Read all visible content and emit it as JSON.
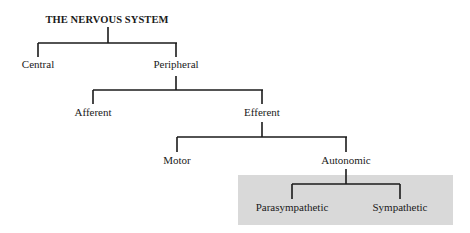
{
  "diagram": {
    "type": "tree",
    "title": "THE NERVOUS SYSTEM",
    "nodes": {
      "root": "THE NERVOUS SYSTEM",
      "central": "Central",
      "peripheral": "Peripheral",
      "afferent": "Afferent",
      "efferent": "Efferent",
      "motor": "Motor",
      "autonomic": "Autonomic",
      "parasympathetic": "Parasympathetic",
      "sympathetic": "Sympathetic"
    },
    "edges": [
      [
        "THE NERVOUS SYSTEM",
        "Central"
      ],
      [
        "THE NERVOUS SYSTEM",
        "Peripheral"
      ],
      [
        "Peripheral",
        "Afferent"
      ],
      [
        "Peripheral",
        "Efferent"
      ],
      [
        "Efferent",
        "Motor"
      ],
      [
        "Efferent",
        "Autonomic"
      ],
      [
        "Autonomic",
        "Parasympathetic"
      ],
      [
        "Autonomic",
        "Sympathetic"
      ]
    ],
    "highlight": {
      "nodes": [
        "Parasympathetic",
        "Sympathetic"
      ],
      "color": "#d9d9d9"
    }
  }
}
